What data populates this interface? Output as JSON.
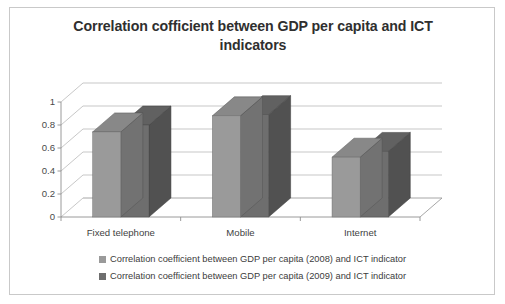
{
  "chart_data": {
    "type": "bar",
    "title": "Correlation cofficient between GDP per capita and ICT indicators",
    "categories": [
      "Fixed telephone",
      "Mobile",
      "Internet"
    ],
    "series": [
      {
        "name": "Correlation coefficient between GDP per capita (2008) and ICT indicator",
        "color": "#9a9a9a",
        "values": [
          0.74,
          0.88,
          0.52
        ]
      },
      {
        "name": "Correlation coefficient between GDP per capita (2009) and ICT indicator",
        "color": "#6e6e6e",
        "values": [
          0.8,
          0.89,
          0.57
        ]
      }
    ],
    "xlabel": "",
    "ylabel": "",
    "ylim": [
      0,
      1
    ],
    "yticks": [
      "0",
      "0.2",
      "0.4",
      "0.6",
      "0.8",
      "1"
    ],
    "ytick_values": [
      0,
      0.2,
      0.4,
      0.6,
      0.8,
      1
    ],
    "grid": true,
    "legend_position": "bottom",
    "style": "3d-clustered-column"
  },
  "figure": {
    "border_color": "#c9c9c9",
    "background": "#ffffff",
    "title_color": "#2f2f2f"
  }
}
